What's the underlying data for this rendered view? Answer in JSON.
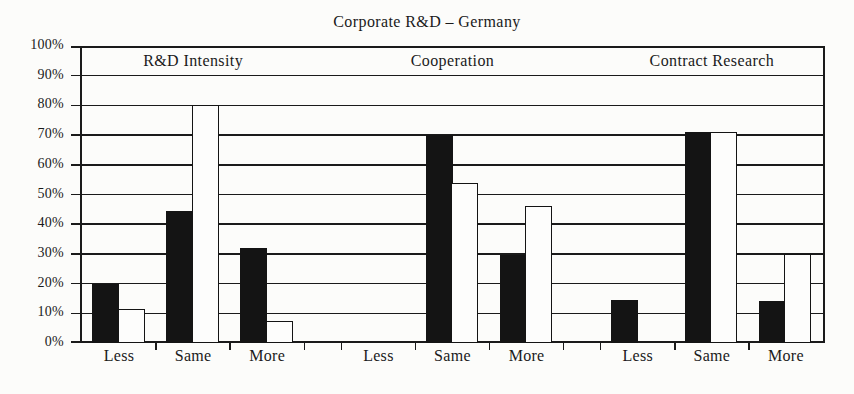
{
  "chart_data": {
    "type": "bar",
    "title": "Corporate R&D – Germany",
    "group_labels": [
      "R&D Intensity",
      "Cooperation",
      "Contract Research"
    ],
    "categories": [
      "Less",
      "Same",
      "More",
      "Less",
      "Same",
      "More",
      "Less",
      "Same",
      "More"
    ],
    "series": [
      {
        "name": "filled-black-bar",
        "color": "#141414",
        "values": [
          20,
          44.5,
          32,
          0,
          70,
          29.5,
          14.5,
          71,
          14
        ]
      },
      {
        "name": "open-white-bar",
        "color": "#fdfdfc",
        "values": [
          11.5,
          80,
          7.5,
          0,
          54,
          46,
          0,
          71,
          30
        ]
      }
    ],
    "xlabel": "",
    "ylabel": "",
    "ylim": [
      0,
      100
    ],
    "y_tick_step": 10,
    "y_tick_labels": [
      "0%",
      "10%",
      "20%",
      "30%",
      "40%",
      "50%",
      "60%",
      "70%",
      "80%",
      "90%",
      "100%"
    ],
    "grid": "horizontal",
    "legend": "none"
  },
  "colors": {
    "ink": "#1a1a1a",
    "paper": "#fcfcfa",
    "bar_fill": "#141414",
    "bar_open_fill": "#fdfdfc"
  }
}
